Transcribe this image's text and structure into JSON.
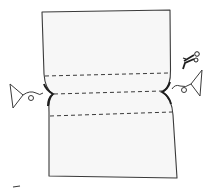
{
  "diagram": {
    "type": "sewing-illustration",
    "colors": {
      "background": "#ffffff",
      "fabric_fill": "#f7f7f7",
      "ink": "#3a3a3a",
      "ink_dark": "#1e1e1e"
    },
    "elements": {
      "fabric": {
        "label": "fabric-piece"
      },
      "fold_lines": [
        {
          "label": "upper-dashed-line"
        },
        {
          "label": "middle-dashed-line"
        },
        {
          "label": "lower-dashed-line"
        }
      ],
      "left_clip": {
        "label": "left-clip"
      },
      "right_clip": {
        "label": "right-clip"
      },
      "scissors": {
        "label": "scissors"
      }
    }
  }
}
